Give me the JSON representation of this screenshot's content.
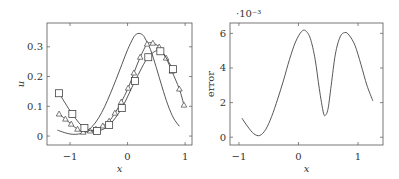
{
  "chart_data": [
    {
      "type": "line",
      "title": "",
      "xlabel": "x",
      "ylabel": "u",
      "xlim": [
        -1.4,
        1.12
      ],
      "ylim": [
        -0.03,
        0.38
      ],
      "xticks": [
        -1,
        0,
        1
      ],
      "xtick_labels": [
        "−1",
        "0",
        "1"
      ],
      "yticks": [
        0,
        0.1,
        0.2,
        0.3
      ],
      "ytick_labels": [
        "0",
        "0.1",
        "0.2",
        "0.3"
      ],
      "grid": false,
      "legend": null,
      "series": [
        {
          "name": "curve-plain",
          "marker": "none",
          "x": [
            -1.22,
            -1.1,
            -1.0,
            -0.9,
            -0.8,
            -0.7,
            -0.6,
            -0.5,
            -0.4,
            -0.3,
            -0.2,
            -0.1,
            0.0,
            0.1,
            0.15,
            0.2,
            0.25,
            0.3,
            0.4,
            0.5,
            0.6,
            0.7,
            0.8,
            0.9
          ],
          "y": [
            0.02,
            0.012,
            0.007,
            0.006,
            0.009,
            0.018,
            0.035,
            0.062,
            0.098,
            0.142,
            0.19,
            0.24,
            0.29,
            0.33,
            0.342,
            0.345,
            0.342,
            0.33,
            0.29,
            0.23,
            0.165,
            0.105,
            0.06,
            0.033
          ]
        },
        {
          "name": "curve-triangles",
          "marker": "triangle",
          "x": [
            -1.19,
            -1.08,
            -0.98,
            -0.87,
            -0.77,
            -0.65,
            -0.55,
            -0.43,
            -0.32,
            -0.22,
            -0.11,
            0.01,
            0.11,
            0.22,
            0.34,
            0.44,
            0.55,
            0.67,
            0.77,
            0.9,
            0.98
          ],
          "y": [
            0.074,
            0.057,
            0.04,
            0.023,
            0.013,
            0.017,
            0.023,
            0.034,
            0.05,
            0.077,
            0.114,
            0.161,
            0.212,
            0.265,
            0.309,
            0.312,
            0.299,
            0.262,
            0.218,
            0.158,
            0.104
          ]
        },
        {
          "name": "curve-squares",
          "marker": "square",
          "x": [
            -1.19,
            -0.96,
            -0.75,
            -0.53,
            -0.32,
            -0.1,
            0.13,
            0.36,
            0.57,
            0.79
          ],
          "y": [
            0.144,
            0.074,
            0.027,
            0.017,
            0.037,
            0.094,
            0.185,
            0.265,
            0.285,
            0.225
          ]
        }
      ],
      "annotations": []
    },
    {
      "type": "line",
      "title": "",
      "xlabel": "x",
      "ylabel": "error",
      "y_scale_label": "·10⁻³",
      "y_multiplier": 0.001,
      "xlim": [
        -1.15,
        1.42
      ],
      "ylim": [
        -0.45,
        6.6
      ],
      "xticks": [
        -1,
        0,
        1
      ],
      "xtick_labels": [
        "−1",
        "0",
        "1"
      ],
      "yticks": [
        0,
        2,
        4,
        6
      ],
      "ytick_labels": [
        "0",
        "2",
        "4",
        "6"
      ],
      "grid": false,
      "legend": null,
      "series": [
        {
          "name": "error",
          "marker": "none",
          "x": [
            -0.95,
            -0.85,
            -0.75,
            -0.65,
            -0.55,
            -0.45,
            -0.35,
            -0.25,
            -0.15,
            -0.05,
            0.05,
            0.12,
            0.2,
            0.28,
            0.35,
            0.42,
            0.46,
            0.5,
            0.55,
            0.62,
            0.7,
            0.78,
            0.85,
            0.95,
            1.05,
            1.15,
            1.25
          ],
          "y": [
            1.1,
            0.6,
            0.2,
            0.1,
            0.45,
            1.2,
            2.2,
            3.3,
            4.5,
            5.5,
            6.1,
            6.15,
            5.7,
            4.5,
            2.8,
            1.4,
            1.3,
            1.7,
            3.0,
            4.8,
            5.8,
            6.05,
            5.9,
            5.3,
            4.2,
            3.0,
            2.1
          ]
        }
      ],
      "annotations": []
    }
  ]
}
